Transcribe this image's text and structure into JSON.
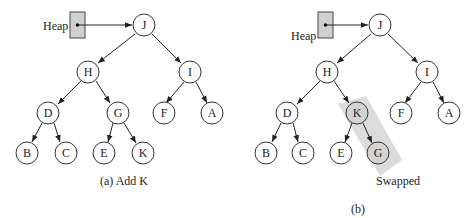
{
  "panels": [
    {
      "id": "a",
      "caption": "(a) Add K",
      "heap_label": "Heap",
      "nodes": {
        "J": "J",
        "H": "H",
        "I": "I",
        "D": "D",
        "G": "G",
        "F": "F",
        "A": "A",
        "B": "B",
        "C": "C",
        "E": "E",
        "K": "K"
      }
    },
    {
      "id": "b",
      "caption": "(b)",
      "heap_label": "Heap",
      "annotation": "Swapped",
      "nodes": {
        "J": "J",
        "H": "H",
        "I": "I",
        "D": "D",
        "K": "K",
        "F": "F",
        "A": "A",
        "B": "B",
        "C": "C",
        "E": "E",
        "G": "G"
      },
      "shaded_nodes": [
        "K",
        "G"
      ]
    }
  ],
  "colors": {
    "shade": "#d4d4d4",
    "highlight_band": "#dcdcdc",
    "heap_box": "#d0d0d0"
  }
}
